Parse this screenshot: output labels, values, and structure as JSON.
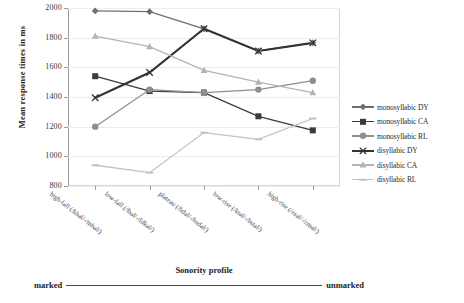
{
  "chart_data": {
    "type": "line",
    "title": "",
    "xlabel": "Sonority profile",
    "ylabel": "Mean response times in ms",
    "ylim": [
      800,
      2000
    ],
    "yticks": [
      800,
      1000,
      1200,
      1400,
      1600,
      1800,
      2000
    ],
    "grid": true,
    "legend_position": "right",
    "categories": [
      "high-fall (/kbal/-/mbal/)",
      "low-fall (/lbal/-/fdkal/)",
      "plateau (/bdal/-/bsdal/)",
      "low-rise (/ktal/-/bstal/)",
      "high-rise (/zsal/-/zmal/)"
    ],
    "annotation_left": "marked",
    "annotation_right": "unmarked",
    "series": [
      {
        "name": "monosyllabic DY",
        "marker": "diamond",
        "color": "#6f6f6f",
        "values": [
          1980,
          1975,
          1860,
          1710,
          1765
        ]
      },
      {
        "name": "monosyllabic CA",
        "marker": "square",
        "color": "#3a3a3a",
        "values": [
          1540,
          1440,
          1430,
          1270,
          1175
        ]
      },
      {
        "name": "monosyllabic RL",
        "marker": "circle",
        "color": "#8f8f8f",
        "values": [
          1200,
          1450,
          1430,
          1450,
          1510
        ]
      },
      {
        "name": "disyllabic DY",
        "marker": "cross",
        "color": "#333333",
        "values": [
          1395,
          1565,
          1860,
          1710,
          1765
        ]
      },
      {
        "name": "disyllabic CA",
        "marker": "triangle",
        "color": "#b4b4b4",
        "values": [
          1810,
          1740,
          1580,
          1500,
          1430
        ]
      },
      {
        "name": "disyllabic RL",
        "marker": "dash",
        "color": "#c2c2c2",
        "values": [
          940,
          890,
          1160,
          1115,
          1255
        ]
      }
    ]
  }
}
